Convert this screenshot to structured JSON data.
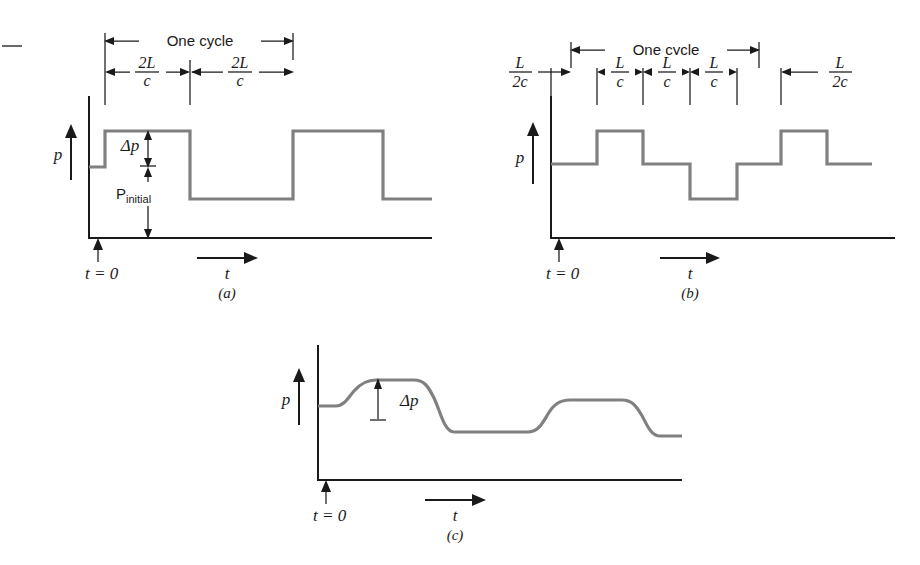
{
  "figure": {
    "background_color": "#ffffff",
    "wave_color": "#808080",
    "axis_color": "#1a1a1a"
  },
  "panels": [
    {
      "id": "a",
      "label": "(a)",
      "y_axis_label": "p",
      "x_axis_label": "t",
      "origin_label": "t = 0",
      "cycle_label": "One cycle",
      "delta_label": "Δp",
      "baseline_label": "P",
      "baseline_sub": "initial",
      "segments": [
        {
          "numerator": "2L",
          "denominator": "c"
        },
        {
          "numerator": "2L",
          "denominator": "c"
        }
      ],
      "waveform": {
        "type": "square",
        "levels_desc": "initial level, then +Δp high for 2L/c, then low for 2L/c, repeating",
        "points": [
          {
            "t": 0.0,
            "p": 1.0
          },
          {
            "t": 0.06,
            "p": 1.0
          },
          {
            "t": 0.06,
            "p": 1.62
          },
          {
            "t": 0.6,
            "p": 1.62
          },
          {
            "t": 0.6,
            "p": 0.38
          },
          {
            "t": 1.26,
            "p": 0.38
          },
          {
            "t": 1.26,
            "p": 1.62
          },
          {
            "t": 1.92,
            "p": 1.62
          },
          {
            "t": 1.92,
            "p": 0.38
          },
          {
            "t": 2.3,
            "p": 0.38
          }
        ]
      }
    },
    {
      "id": "b",
      "label": "(b)",
      "y_axis_label": "p",
      "x_axis_label": "t",
      "origin_label": "t = 0",
      "cycle_label": "One cycle",
      "segments": [
        {
          "numerator": "L",
          "denominator": "2c"
        },
        {
          "numerator": "L",
          "denominator": "c"
        },
        {
          "numerator": "L",
          "denominator": "c"
        },
        {
          "numerator": "L",
          "denominator": "c"
        },
        {
          "numerator": "L",
          "denominator": "2c"
        }
      ],
      "waveform": {
        "type": "staircase",
        "levels_desc": "stepped square wave with half-amplitude shoulders",
        "points": [
          {
            "t": 0.0,
            "p": 1.0
          },
          {
            "t": 0.28,
            "p": 1.0
          },
          {
            "t": 0.28,
            "p": 1.5
          },
          {
            "t": 0.8,
            "p": 1.5
          },
          {
            "t": 0.8,
            "p": 1.0
          },
          {
            "t": 1.32,
            "p": 1.0
          },
          {
            "t": 1.32,
            "p": 0.5
          },
          {
            "t": 1.84,
            "p": 0.5
          },
          {
            "t": 1.84,
            "p": 1.0
          },
          {
            "t": 2.2,
            "p": 1.0
          },
          {
            "t": 2.2,
            "p": 1.5
          },
          {
            "t": 2.72,
            "p": 1.5
          },
          {
            "t": 2.72,
            "p": 1.0
          },
          {
            "t": 3.1,
            "p": 1.0
          }
        ]
      }
    },
    {
      "id": "c",
      "label": "(c)",
      "y_axis_label": "p",
      "x_axis_label": "t",
      "origin_label": "t = 0",
      "delta_label": "Δp",
      "waveform": {
        "type": "smoothed-square",
        "levels_desc": "damped square wave with rounded rise and fall edges",
        "points": [
          {
            "t": 0.0,
            "p": 1.0
          },
          {
            "t": 0.14,
            "p": 1.0
          },
          {
            "t": 0.3,
            "p": 1.55
          },
          {
            "t": 0.72,
            "p": 1.58
          },
          {
            "t": 0.95,
            "p": 0.46
          },
          {
            "t": 1.45,
            "p": 0.43
          },
          {
            "t": 1.72,
            "p": 1.38
          },
          {
            "t": 2.22,
            "p": 1.4
          },
          {
            "t": 2.48,
            "p": 0.62
          },
          {
            "t": 3.0,
            "p": 0.62
          }
        ]
      }
    }
  ],
  "margin_mark": {
    "name": "page-margin-dash",
    "visible": true
  }
}
